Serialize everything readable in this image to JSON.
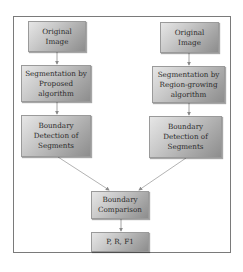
{
  "diagram": {
    "type": "flowchart",
    "left_branch": {
      "original_image": "Original Image",
      "segmentation": "Segmentation by Proposed algorithm",
      "boundary_detection": "Boundary Detection of Segments"
    },
    "right_branch": {
      "original_image": "Original Image",
      "segmentation": "Segmentation by Region-growing algorithm",
      "boundary_detection": "Boundary Detection of Segments"
    },
    "merge": {
      "comparison": "Boundary Comparison",
      "metrics": "P, R, F1"
    },
    "edges": [
      [
        "left_branch.original_image",
        "left_branch.segmentation"
      ],
      [
        "left_branch.segmentation",
        "left_branch.boundary_detection"
      ],
      [
        "right_branch.original_image",
        "right_branch.segmentation"
      ],
      [
        "right_branch.segmentation",
        "right_branch.boundary_detection"
      ],
      [
        "left_branch.boundary_detection",
        "merge.comparison"
      ],
      [
        "right_branch.boundary_detection",
        "merge.comparison"
      ],
      [
        "merge.comparison",
        "merge.metrics"
      ]
    ],
    "colors": {
      "box_light": "#e6e6e6",
      "box_dark": "#8d8d8d",
      "frame_border": "#7a7a7a",
      "arrow": "#8a8a8a"
    }
  }
}
